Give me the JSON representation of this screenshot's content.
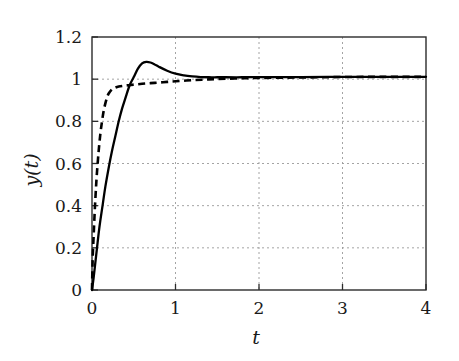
{
  "chart_data": {
    "type": "line",
    "title": "",
    "subtitle": "",
    "xlabel": "t",
    "ylabel": "y(t)",
    "xlim": [
      0,
      4
    ],
    "ylim": [
      0,
      1.2
    ],
    "grid": true,
    "legend": "none",
    "xticks": [
      0,
      1,
      2,
      3,
      4
    ],
    "xtick_labels": [
      "0",
      "1",
      "2",
      "3",
      "4"
    ],
    "yticks": [
      0,
      0.2,
      0.4,
      0.6,
      0.8,
      1,
      1.2
    ],
    "ytick_labels": [
      "0",
      "0.2",
      "0.4",
      "0.6",
      "0.8",
      "1",
      "1.2"
    ],
    "series": [
      {
        "name": "solid-response",
        "style": "solid",
        "color": "#000000",
        "x": [
          0.0,
          0.02,
          0.04,
          0.06,
          0.08,
          0.1,
          0.13,
          0.16,
          0.2,
          0.24,
          0.28,
          0.32,
          0.36,
          0.4,
          0.45,
          0.5,
          0.55,
          0.6,
          0.65,
          0.7,
          0.75,
          0.8,
          0.9,
          1.0,
          1.1,
          1.2,
          1.3,
          1.4,
          1.5,
          1.6,
          1.8,
          2.0,
          2.2,
          2.5,
          3.0,
          3.5,
          4.0
        ],
        "y": [
          0.0,
          0.06,
          0.13,
          0.2,
          0.27,
          0.33,
          0.41,
          0.49,
          0.58,
          0.66,
          0.73,
          0.8,
          0.86,
          0.91,
          0.97,
          1.01,
          1.05,
          1.075,
          1.082,
          1.079,
          1.07,
          1.059,
          1.04,
          1.026,
          1.018,
          1.013,
          1.01,
          1.009,
          1.009,
          1.009,
          1.009,
          1.01,
          1.01,
          1.01,
          1.011,
          1.011,
          1.011
        ]
      },
      {
        "name": "dashed-response",
        "style": "dashed",
        "color": "#000000",
        "x": [
          0.0,
          0.005,
          0.01,
          0.02,
          0.03,
          0.04,
          0.05,
          0.06,
          0.08,
          0.1,
          0.12,
          0.14,
          0.16,
          0.18,
          0.2,
          0.24,
          0.28,
          0.32,
          0.4,
          0.5,
          0.6,
          0.7,
          0.8,
          0.9,
          1.0,
          1.2,
          1.4,
          1.6,
          1.8,
          2.0,
          2.5,
          3.0,
          3.5,
          4.0
        ],
        "y": [
          0.0,
          0.1,
          0.17,
          0.26,
          0.35,
          0.43,
          0.5,
          0.56,
          0.66,
          0.74,
          0.8,
          0.85,
          0.885,
          0.912,
          0.932,
          0.952,
          0.96,
          0.965,
          0.97,
          0.974,
          0.978,
          0.981,
          0.984,
          0.987,
          0.99,
          0.995,
          0.999,
          1.002,
          1.004,
          1.006,
          1.008,
          1.01,
          1.011,
          1.011
        ]
      }
    ],
    "annotations": {
      "peak_value": 1.08,
      "peak_time": 0.62,
      "steady_state": 1.01
    }
  },
  "axes": {
    "y_axis_title": "y(t)",
    "x_axis_title": "t"
  }
}
